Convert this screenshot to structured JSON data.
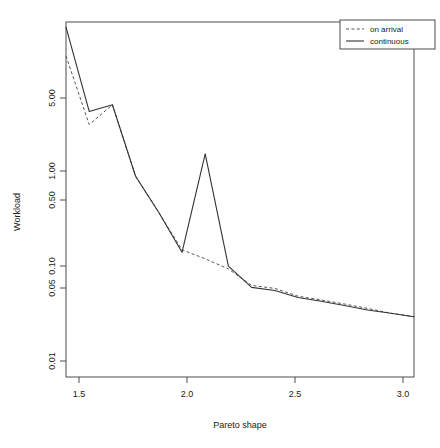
{
  "chart_data": {
    "type": "line",
    "title": "",
    "xlabel": "Pareto shape",
    "ylabel": "Workload",
    "xlim": [
      1.5,
      3.0
    ],
    "ylim": [
      0.0085,
      9.5
    ],
    "yscale": "log",
    "grid": false,
    "legend_position": "top-right",
    "x": [
      1.5,
      1.6,
      1.7,
      1.8,
      1.9,
      2.0,
      2.1,
      2.2,
      2.3,
      2.4,
      2.5,
      2.6,
      2.7,
      2.8,
      2.9,
      3.0
    ],
    "series": [
      {
        "name": "on arrival",
        "style": "dashed",
        "color": "#555555",
        "values": [
          4.85,
          1.25,
          1.85,
          0.45,
          0.22,
          0.105,
          0.088,
          0.072,
          0.052,
          0.049,
          0.042,
          0.039,
          0.036,
          0.033,
          0.03,
          0.028
        ]
      },
      {
        "name": "continuous",
        "style": "solid",
        "color": "#333333",
        "values": [
          8.6,
          1.62,
          1.85,
          0.45,
          0.22,
          0.1,
          0.7,
          0.076,
          0.05,
          0.047,
          0.041,
          0.038,
          0.035,
          0.032,
          0.03,
          0.028
        ]
      }
    ],
    "xticks": [
      1.5,
      2.0,
      2.5,
      3.0
    ],
    "xtick_labels": [
      "1.5",
      "2.0",
      "2.5",
      "3.0"
    ],
    "yticks": [
      0.01,
      0.05,
      0.1,
      0.5,
      1.0,
      5.0
    ],
    "ytick_labels": [
      "0.01",
      "0.05",
      "0.10",
      "0.50",
      "1.00",
      "5.00"
    ]
  },
  "legend": {
    "entries": [
      {
        "label": "on arrival"
      },
      {
        "label": "continuous"
      }
    ]
  },
  "axes": {
    "x_title": "Pareto shape",
    "y_title": "Workload"
  }
}
